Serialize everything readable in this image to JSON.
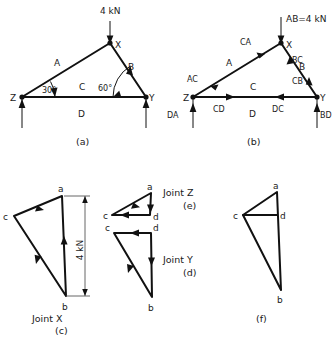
{
  "figure": {
    "background": "#ffffff",
    "ink": "#111111"
  },
  "panel_a": {
    "caption": "(a)",
    "load_label": "4 kN",
    "joints": [
      {
        "name": "X",
        "x": 110,
        "y": 43
      },
      {
        "name": "Z",
        "x": 22,
        "y": 97
      },
      {
        "name": "Y",
        "x": 146,
        "y": 97
      }
    ],
    "spaces": [
      {
        "label": "A",
        "x": 58,
        "y": 62
      },
      {
        "label": "B",
        "x": 131,
        "y": 66
      },
      {
        "label": "C",
        "x": 83,
        "y": 86
      },
      {
        "label": "D",
        "x": 82,
        "y": 113
      }
    ],
    "angles": [
      {
        "label": "30°",
        "x": 44,
        "y": 89
      },
      {
        "label": "60°",
        "x": 100,
        "y": 87
      }
    ],
    "reactions": [
      "up",
      "up"
    ]
  },
  "panel_b": {
    "caption": "(b)",
    "load_label": "AB=4 kN",
    "joints": [
      {
        "name": "X",
        "x": 281,
        "y": 43
      },
      {
        "name": "Z",
        "x": 193,
        "y": 97
      },
      {
        "name": "Y",
        "x": 317,
        "y": 97
      }
    ],
    "spaces": [
      {
        "label": "A",
        "x": 229,
        "y": 62
      },
      {
        "label": "B",
        "x": 302,
        "y": 66
      },
      {
        "label": "C",
        "x": 254,
        "y": 86
      },
      {
        "label": "D",
        "x": 253,
        "y": 113
      }
    ],
    "member_forces": [
      {
        "label": "CA",
        "x": 247,
        "y": 48
      },
      {
        "label": "AC",
        "x": 196,
        "y": 82
      },
      {
        "label": "BC",
        "x": 291,
        "y": 62
      },
      {
        "label": "CB",
        "x": 290,
        "y": 85
      },
      {
        "label": "CD",
        "x": 218,
        "y": 108
      },
      {
        "label": "DC",
        "x": 279,
        "y": 108
      },
      {
        "label": "DA",
        "x": 169,
        "y": 113
      },
      {
        "label": "BD",
        "x": 321,
        "y": 113
      }
    ]
  },
  "panel_c": {
    "caption": "(c)",
    "name": "Joint X",
    "dimension_label": "4 kN",
    "vertices": [
      {
        "name": "a",
        "x": 62,
        "y": 196
      },
      {
        "name": "c",
        "x": 14,
        "y": 216
      },
      {
        "name": "b",
        "x": 66,
        "y": 296
      }
    ]
  },
  "panel_d": {
    "caption": "(d)",
    "name": "Joint Y",
    "vertices": [
      {
        "name": "c",
        "x": 114,
        "y": 233
      },
      {
        "name": "d",
        "x": 151,
        "y": 233
      },
      {
        "name": "b",
        "x": 152,
        "y": 297
      }
    ]
  },
  "panel_e": {
    "caption": "(e)",
    "name": "Joint Z",
    "vertices": [
      {
        "name": "a",
        "x": 151,
        "y": 193
      },
      {
        "name": "c",
        "x": 112,
        "y": 215
      },
      {
        "name": "d",
        "x": 150,
        "y": 215
      }
    ]
  },
  "panel_f": {
    "caption": "(f)",
    "vertices": [
      {
        "name": "a",
        "x": 277,
        "y": 192
      },
      {
        "name": "c",
        "x": 243,
        "y": 215
      },
      {
        "name": "d",
        "x": 277,
        "y": 215
      },
      {
        "name": "b",
        "x": 281,
        "y": 290
      }
    ]
  }
}
